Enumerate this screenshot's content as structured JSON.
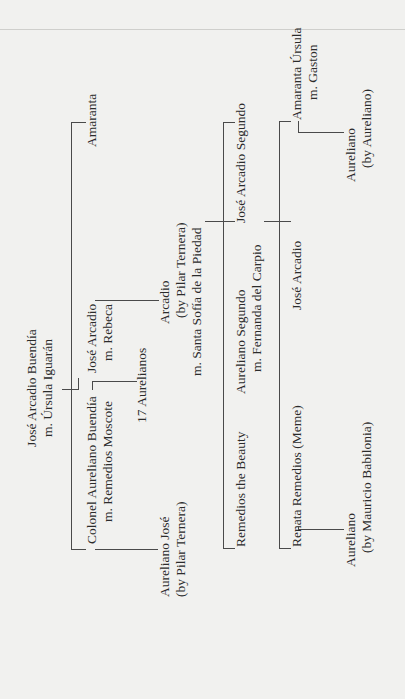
{
  "generations": {
    "gen1": {
      "name": "José Arcadio Buendía",
      "spouse": "m. Úrsula Iguarán"
    },
    "gen2": {
      "colonel": {
        "name": "Colonel Aureliano Buendía",
        "spouse": "m. Remedios Moscote"
      },
      "jose_arcadio": {
        "name": "José Arcadio",
        "spouse": "m. Rebeca"
      },
      "amaranta": {
        "name": "Amaranta"
      }
    },
    "gen2_children": {
      "aureliano_jose": {
        "name": "Aureliano José",
        "note": "(by Pilar Ternera)"
      },
      "seventeen": {
        "name": "17 Aurelianos"
      },
      "arcadio": {
        "name": "Arcadio",
        "note": "(by Pilar Ternera)",
        "spouse": "m. Santa Sofía de la Piedad"
      }
    },
    "gen3": {
      "remedios": {
        "name": "Remedios the Beauty"
      },
      "aureliano_segundo": {
        "name": "Aureliano Segundo",
        "spouse": "m. Fernanda del Carpio"
      },
      "jose_arcadio_segundo": {
        "name": "José Arcadio Segundo"
      }
    },
    "gen4": {
      "renata": {
        "name": "Renata Remedios (Meme)"
      },
      "jose_arcadio": {
        "name": "José Arcadio"
      },
      "amaranta_ursula": {
        "name": "Amaranta Úrsula",
        "spouse": "m. Gaston"
      }
    },
    "gen5": {
      "aureliano_meme": {
        "name": "Aureliano",
        "note": "(by Mauricio Babilonia)"
      },
      "aureliano_amaranta": {
        "name": "Aureliano",
        "note": "(by Aureliano)"
      }
    }
  },
  "colors": {
    "background": "#f1f1ef",
    "line": "#4a4a4a",
    "text": "#2b2b2b"
  }
}
